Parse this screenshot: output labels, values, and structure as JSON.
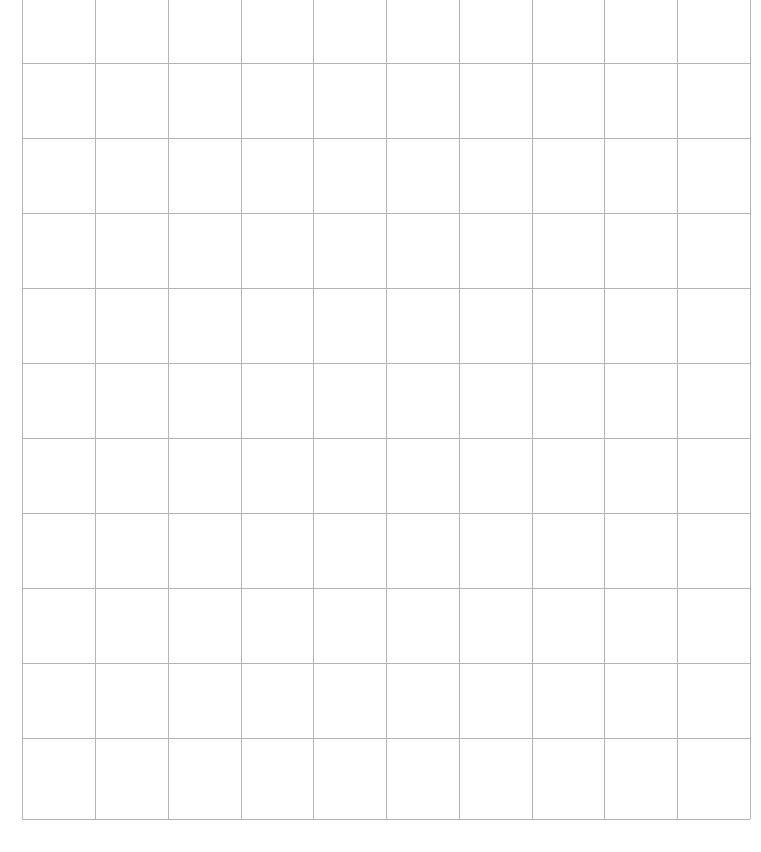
{
  "document": {
    "type": "blank-grid",
    "title": "Blank grid",
    "background_color": "#ffffff",
    "line_color": "#b3b3b3",
    "line_width_px": 1
  },
  "grid": {
    "columns": 10,
    "rows": 10,
    "column_width_px": 72.8,
    "row_height_px": 75.1,
    "left_px": 22,
    "right_px": 750,
    "bottom_px": 819,
    "top_row_clipped": true,
    "vertical_line_x": [
      22,
      95,
      168,
      241,
      313,
      386,
      459,
      532,
      604,
      677,
      750
    ],
    "horizontal_line_y": [
      63,
      138,
      213,
      288,
      363,
      438,
      513,
      588,
      663,
      738,
      819
    ],
    "column_labels": [
      "1",
      "2",
      "3",
      "4",
      "5",
      "6",
      "7",
      "8",
      "9",
      "10"
    ],
    "row_labels": [
      "1",
      "2",
      "3",
      "4",
      "5",
      "6",
      "7",
      "8",
      "9",
      "10"
    ],
    "cells": [
      [
        "",
        "",
        "",
        "",
        "",
        "",
        "",
        "",
        "",
        ""
      ],
      [
        "",
        "",
        "",
        "",
        "",
        "",
        "",
        "",
        "",
        ""
      ],
      [
        "",
        "",
        "",
        "",
        "",
        "",
        "",
        "",
        "",
        ""
      ],
      [
        "",
        "",
        "",
        "",
        "",
        "",
        "",
        "",
        "",
        ""
      ],
      [
        "",
        "",
        "",
        "",
        "",
        "",
        "",
        "",
        "",
        ""
      ],
      [
        "",
        "",
        "",
        "",
        "",
        "",
        "",
        "",
        "",
        ""
      ],
      [
        "",
        "",
        "",
        "",
        "",
        "",
        "",
        "",
        "",
        ""
      ],
      [
        "",
        "",
        "",
        "",
        "",
        "",
        "",
        "",
        "",
        ""
      ],
      [
        "",
        "",
        "",
        "",
        "",
        "",
        "",
        "",
        "",
        ""
      ],
      [
        "",
        "",
        "",
        "",
        "",
        "",
        "",
        "",
        "",
        ""
      ]
    ]
  }
}
